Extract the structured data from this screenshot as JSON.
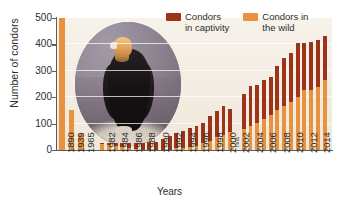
{
  "chart_data": {
    "type": "bar",
    "title": "",
    "subtitle": "",
    "xlabel": "Years",
    "ylabel": "Number of condors",
    "ylim": [
      0,
      500
    ],
    "yticks": [
      0,
      100,
      200,
      300,
      400,
      500
    ],
    "grid": true,
    "stacked": true,
    "legend_position": "top-right",
    "legend": [
      "Condors in captivity",
      "Condors in the wild"
    ],
    "colors": {
      "captivity": "#9d3318",
      "wild": "#e8923f",
      "plot_background": "#f3ece2",
      "axis": "#5d5d5b",
      "text": "#2e2e2c"
    },
    "categories": [
      "1890",
      "1939",
      "1965",
      "1982",
      "1983",
      "1984",
      "1985",
      "1986",
      "1987",
      "1988",
      "1989",
      "1990",
      "1991",
      "1992",
      "1993",
      "1994",
      "1995",
      "1996",
      "1997",
      "1998",
      "1999",
      "2000",
      "2001",
      "2002",
      "2003",
      "2004",
      "2005",
      "2006",
      "2007",
      "2008",
      "2009",
      "2010",
      "2011",
      "2012",
      "2013",
      "2014",
      "2015"
    ],
    "tick_labels": [
      "1890",
      "1939",
      "1965",
      "1982",
      "",
      "1984",
      "",
      "1986",
      "",
      "1988",
      "",
      "1990",
      "",
      "1992",
      "",
      "1994",
      "",
      "1996",
      "",
      "1998",
      "",
      "2000",
      "",
      "2002",
      "",
      "2004",
      "",
      "2006",
      "",
      "2008",
      "",
      "2010",
      "",
      "2012",
      "",
      "2014",
      ""
    ],
    "series": [
      {
        "name": "Condors in the wild",
        "color": "#e8923f",
        "values": [
          500,
          150,
          60,
          22,
          19,
          15,
          12,
          9,
          3,
          0,
          0,
          0,
          0,
          0,
          8,
          9,
          12,
          17,
          25,
          33,
          48,
          56,
          68,
          null,
          78,
          90,
          102,
          117,
          131,
          151,
          168,
          181,
          200,
          226,
          228,
          237,
          264
        ]
      },
      {
        "name": "Condors in captivity",
        "color": "#9d3318",
        "values": [
          0,
          0,
          0,
          3,
          6,
          12,
          15,
          18,
          24,
          27,
          29,
          32,
          40,
          52,
          55,
          62,
          71,
          74,
          79,
          96,
          101,
          112,
          86,
          null,
          134,
          154,
          143,
          150,
          146,
          169,
          180,
          187,
          205,
          179,
          181,
          181,
          168
        ]
      }
    ],
    "totals": [
      500,
      150,
      60,
      25,
      25,
      27,
      27,
      27,
      27,
      27,
      29,
      32,
      40,
      52,
      63,
      71,
      83,
      91,
      104,
      129,
      149,
      168,
      154,
      null,
      212,
      244,
      245,
      267,
      277,
      320,
      348,
      368,
      405,
      405,
      409,
      418,
      432
    ],
    "annotations": [
      {
        "text": "n/a",
        "category": "2002",
        "orientation": "vertical",
        "note": "no data available for 2002"
      }
    ],
    "inset_image": {
      "name": "california-condor-photo",
      "shape": "circle",
      "description": "California condor standing on rocks"
    }
  },
  "legend": {
    "items": [
      {
        "label": "Condors\nin captivity",
        "color": "#9d3318",
        "icon": "legend-swatch-captivity"
      },
      {
        "label": "Condors in\nthe wild",
        "color": "#e8923f",
        "icon": "legend-swatch-wild"
      }
    ]
  },
  "axes": {
    "y_title": "Number of condors",
    "x_title": "Years"
  }
}
